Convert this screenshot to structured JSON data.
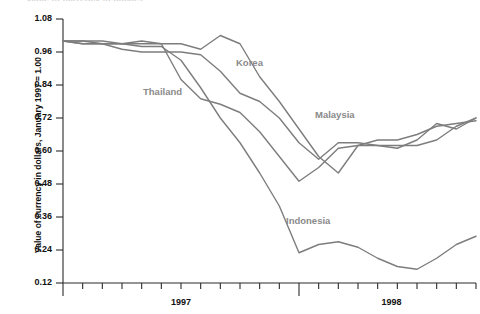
{
  "chart_data": {
    "type": "line",
    "title": "Value of currency in dollars",
    "xlabel": "",
    "ylabel": "Value of currency in dollars, January 1997 = 1.00",
    "ylim": [
      0.12,
      1.08
    ],
    "ytick_labels": [
      "1.08",
      "0.96",
      "0.84",
      "0.72",
      "0.60",
      "0.48",
      "0.36",
      "0.24",
      "0.12"
    ],
    "ytick_values": [
      1.08,
      0.96,
      0.84,
      0.72,
      0.6,
      0.48,
      0.36,
      0.24,
      0.12
    ],
    "xtick_labels": [
      "1997",
      "1998"
    ],
    "xtick_values": [
      1997,
      1998
    ],
    "grid": false,
    "legend_position": "inline-annotations",
    "x_minor_ticks": 22,
    "x": [
      "1997-01",
      "1997-02",
      "1997-03",
      "1997-04",
      "1997-05",
      "1997-06",
      "1997-07",
      "1997-08",
      "1997-09",
      "1997-10",
      "1997-11",
      "1997-12",
      "1998-01",
      "1998-02",
      "1998-03",
      "1998-04",
      "1998-05",
      "1998-06",
      "1998-07",
      "1998-08",
      "1998-09",
      "1998-10"
    ],
    "series": [
      {
        "name": "Korea",
        "color": "#7d7d7d",
        "values": [
          1.0,
          0.99,
          0.99,
          0.99,
          1.0,
          0.99,
          0.99,
          0.97,
          1.02,
          0.99,
          0.87,
          0.78,
          0.68,
          0.58,
          0.52,
          0.62,
          0.64,
          0.64,
          0.66,
          0.69,
          0.7,
          0.71
        ]
      },
      {
        "name": "Thailand",
        "color": "#7d7d7d",
        "values": [
          1.0,
          1.0,
          1.0,
          0.99,
          0.99,
          0.99,
          0.86,
          0.79,
          0.77,
          0.74,
          0.67,
          0.58,
          0.49,
          0.54,
          0.61,
          0.62,
          0.62,
          0.61,
          0.64,
          0.7,
          0.68,
          0.72
        ]
      },
      {
        "name": "Malaysia",
        "color": "#7d7d7d",
        "values": [
          1.0,
          1.0,
          0.99,
          0.97,
          0.96,
          0.96,
          0.96,
          0.95,
          0.89,
          0.81,
          0.78,
          0.72,
          0.63,
          0.57,
          0.63,
          0.63,
          0.62,
          0.62,
          0.62,
          0.64,
          0.69,
          0.72
        ]
      },
      {
        "name": "Indonesia",
        "color": "#7d7d7d",
        "values": [
          1.0,
          0.99,
          0.99,
          0.99,
          0.98,
          0.98,
          0.93,
          0.83,
          0.72,
          0.63,
          0.52,
          0.4,
          0.23,
          0.26,
          0.27,
          0.25,
          0.21,
          0.18,
          0.17,
          0.21,
          0.26,
          0.29
        ]
      }
    ],
    "annotations": [
      {
        "text": "Korea",
        "x_px": 236,
        "y_px": 57
      },
      {
        "text": "Thailand",
        "x_px": 143,
        "y_px": 86
      },
      {
        "text": "Malaysia",
        "x_px": 315,
        "y_px": 109
      },
      {
        "text": "Indonesia",
        "x_px": 286,
        "y_px": 215
      }
    ]
  },
  "axis": {
    "y_title": "Value of currency in dollars, January 1997 = 1.00",
    "y_labels": [
      "1.08",
      "0.96",
      "0.84",
      "0.72",
      "0.60",
      "0.48",
      "0.36",
      "0.24",
      "0.12"
    ],
    "x_labels": [
      "1997",
      "1998"
    ]
  },
  "series_labels": {
    "korea": "Korea",
    "thailand": "Thailand",
    "malaysia": "Malaysia",
    "indonesia": "Indonesia"
  },
  "title": {
    "text": "Value of currency in dollars"
  },
  "colors": {
    "line": "#7d7d7d",
    "axis": "#2b2b2b",
    "label": "#8a8a8a",
    "text": "#111111"
  }
}
